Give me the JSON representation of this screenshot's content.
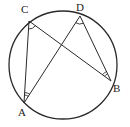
{
  "diagram": {
    "type": "circle-inscribed-angles",
    "colors": {
      "stroke": "#2a2a2a",
      "background": "#ffffff",
      "label": "#222222"
    },
    "circle": {
      "cx": 63,
      "cy": 65,
      "r": 54
    },
    "points": {
      "A": {
        "x": 24,
        "y": 103,
        "label": "A"
      },
      "B": {
        "x": 111,
        "y": 81,
        "label": "B"
      },
      "C": {
        "x": 29,
        "y": 21,
        "label": "C"
      },
      "D": {
        "x": 80,
        "y": 16,
        "label": "D"
      }
    },
    "segments": [
      {
        "from": "C",
        "to": "A"
      },
      {
        "from": "C",
        "to": "B"
      },
      {
        "from": "A",
        "to": "D"
      },
      {
        "from": "D",
        "to": "B"
      }
    ],
    "angle_marks": [
      {
        "vertex": "C",
        "arcs": 1
      },
      {
        "vertex": "D",
        "arcs": 1
      },
      {
        "vertex": "A",
        "arcs": 2
      },
      {
        "vertex": "B",
        "arcs": 2
      }
    ]
  }
}
